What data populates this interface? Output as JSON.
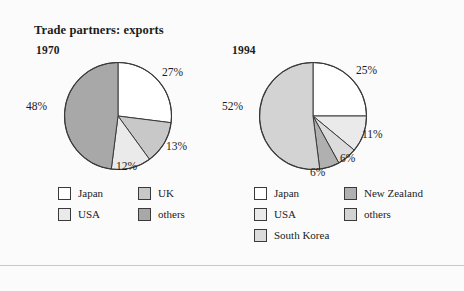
{
  "figure": {
    "title": "Trade partners: exports",
    "background": "#fbfbfb",
    "text_color": "#1b1b1b",
    "outline_color": "#3a3a3a"
  },
  "panels": [
    {
      "id": "1970",
      "year_label": "1970",
      "pct_labels": [
        "27%",
        "13%",
        "12%",
        "48%"
      ],
      "legend": [
        {
          "label": "Japan",
          "color": "#ffffff"
        },
        {
          "label": "USA",
          "color": "#eaeaea"
        },
        {
          "label": "UK",
          "color": "#c8c8c8"
        },
        {
          "label": "others",
          "color": "#a8a8a8"
        }
      ]
    },
    {
      "id": "1994",
      "year_label": "1994",
      "pct_labels": [
        "25%",
        "11%",
        "6%",
        "6%",
        "52%"
      ],
      "legend": [
        {
          "label": "Japan",
          "color": "#ffffff"
        },
        {
          "label": "USA",
          "color": "#eaeaea"
        },
        {
          "label": "South Korea",
          "color": "#dcdcdc"
        },
        {
          "label": "New Zealand",
          "color": "#b0b0b0"
        },
        {
          "label": "others",
          "color": "#d3d3d3"
        }
      ]
    }
  ],
  "chart_data": [
    {
      "type": "pie",
      "title": "1970",
      "categories": [
        "Japan",
        "UK",
        "USA",
        "others"
      ],
      "values": [
        27,
        13,
        12,
        48
      ],
      "labels": [
        "27%",
        "13%",
        "12%",
        "48%"
      ],
      "colors": [
        "#ffffff",
        "#c8c8c8",
        "#eaeaea",
        "#a8a8a8"
      ],
      "start_angle_deg": 0,
      "direction": "clockwise",
      "units": "percent",
      "legend_position": "bottom"
    },
    {
      "type": "pie",
      "title": "1994",
      "categories": [
        "Japan",
        "USA",
        "South Korea",
        "New Zealand",
        "others"
      ],
      "values": [
        25,
        11,
        6,
        6,
        52
      ],
      "labels": [
        "25%",
        "11%",
        "6%",
        "6%",
        "52%"
      ],
      "colors": [
        "#ffffff",
        "#eaeaea",
        "#dcdcdc",
        "#b0b0b0",
        "#d3d3d3"
      ],
      "start_angle_deg": 0,
      "direction": "clockwise",
      "units": "percent",
      "legend_position": "bottom"
    }
  ]
}
